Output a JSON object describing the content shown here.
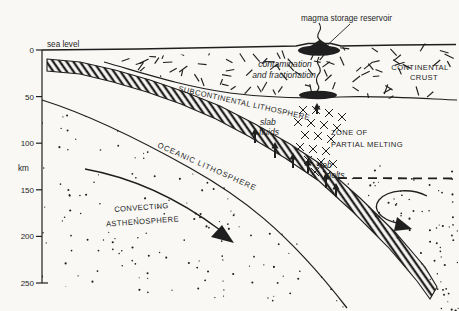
{
  "figure": {
    "type": "subduction-zone-cross-section",
    "colors": {
      "paper": "#f9f8f5",
      "ink": "#1f1f1f"
    },
    "depth_axis": {
      "unit": "km",
      "sea_level": "sea level",
      "ticks": [
        "0",
        "50",
        "100",
        "150",
        "200",
        "250"
      ]
    },
    "labels": {
      "magma_reservoir": "magma storage reservoir",
      "contamination_line1": "contamination",
      "contamination_line2": "and fractionation",
      "continental_crust_line1": "CONTINENTAL",
      "continental_crust_line2": "CRUST",
      "subcontinental_lithosphere": "SUBCONTINENTAL LITHOSPHERE",
      "oceanic_lithosphere": "OCEANIC LITHOSPHERE",
      "zone_line1": "ZONE OF",
      "zone_line2": "PARTIAL MELTING",
      "slab_fluids_line1": "slab",
      "slab_fluids_line2": "fluids",
      "slab_melts_line1": "slab",
      "slab_melts_line2": "melts",
      "convecting_line1": "CONVECTING",
      "convecting_line2": "ASTHENOSPHERE"
    }
  }
}
